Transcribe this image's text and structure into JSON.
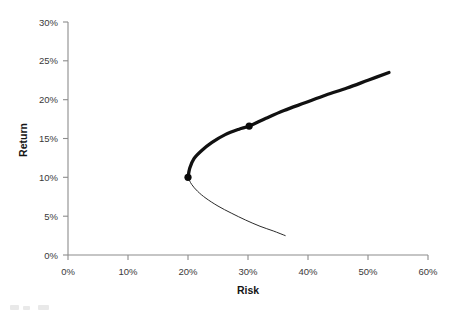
{
  "chart_data": {
    "type": "line",
    "title": "",
    "xlabel": "Risk",
    "ylabel": "Return",
    "xlim": [
      0,
      60
    ],
    "ylim": [
      0,
      30
    ],
    "grid": false,
    "legend": "none",
    "x_tick_labels": [
      "0%",
      "10%",
      "20%",
      "30%",
      "40%",
      "50%",
      "60%"
    ],
    "x_tick_values": [
      0,
      10,
      20,
      30,
      40,
      50,
      60
    ],
    "y_tick_labels": [
      "0%",
      "5%",
      "10%",
      "15%",
      "20%",
      "25%",
      "30%"
    ],
    "y_tick_values": [
      0,
      5,
      10,
      15,
      20,
      25,
      30
    ],
    "series": [
      {
        "name": "Efficient frontier (upper branch)",
        "style": "thick-solid",
        "x": [
          20.0,
          20.3,
          21.0,
          22.2,
          24.0,
          26.2,
          28.5,
          30.2,
          33.0,
          36.0,
          39.5,
          43.0,
          46.5,
          50.0,
          53.5
        ],
        "y": [
          10.0,
          11.2,
          12.4,
          13.4,
          14.5,
          15.5,
          16.2,
          16.6,
          17.6,
          18.6,
          19.6,
          20.6,
          21.5,
          22.5,
          23.5
        ]
      },
      {
        "name": "Inefficient frontier (lower branch)",
        "style": "thin-solid",
        "x": [
          20.0,
          20.6,
          21.6,
          23.0,
          25.0,
          27.2,
          29.6,
          32.0,
          34.2,
          36.2
        ],
        "y": [
          10.0,
          9.1,
          8.2,
          7.3,
          6.3,
          5.4,
          4.5,
          3.7,
          3.1,
          2.5
        ]
      }
    ],
    "points": [
      {
        "name": "minimum-variance-portfolio",
        "x": 20.0,
        "y": 10.0,
        "label": ""
      },
      {
        "name": "tangency-portfolio",
        "x": 30.2,
        "y": 16.6,
        "label": ""
      }
    ]
  }
}
